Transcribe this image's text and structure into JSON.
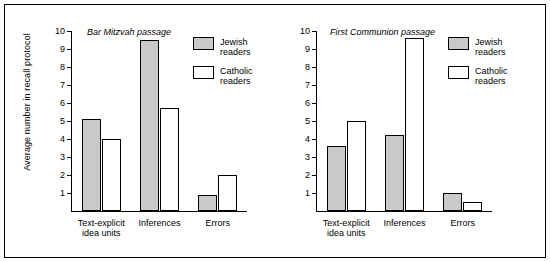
{
  "figure": {
    "ylabel": "Average number in recall protocol",
    "legend": [
      {
        "key": "jewish",
        "label": "Jewish\nreaders",
        "fill": "#c9c9c9"
      },
      {
        "key": "catholic",
        "label": "Catholic\nreaders",
        "fill": "#ffffff"
      }
    ]
  },
  "chart_data": [
    {
      "type": "bar",
      "title": "Bar Mitzvah passage",
      "categories": [
        "Text-explicit\nidea units",
        "Inferences",
        "Errors"
      ],
      "series": [
        {
          "name": "Jewish readers",
          "values": [
            5.1,
            9.5,
            0.9
          ]
        },
        {
          "name": "Catholic readers",
          "values": [
            4.0,
            5.7,
            2.0
          ]
        }
      ],
      "xlabel": "",
      "ylabel": "Average number in recall protocol",
      "ylim": [
        0,
        10
      ],
      "yticks": [
        1,
        2,
        3,
        4,
        5,
        6,
        7,
        8,
        9,
        10
      ],
      "grid": false,
      "legend_position": "top-right"
    },
    {
      "type": "bar",
      "title": "First Communion passage",
      "categories": [
        "Text-explicit\nidea units",
        "Inferences",
        "Errors"
      ],
      "series": [
        {
          "name": "Jewish readers",
          "values": [
            3.6,
            4.2,
            1.0
          ]
        },
        {
          "name": "Catholic readers",
          "values": [
            5.0,
            9.6,
            0.5
          ]
        }
      ],
      "xlabel": "",
      "ylabel": "",
      "ylim": [
        0,
        10
      ],
      "yticks": [
        1,
        2,
        3,
        4,
        5,
        6,
        7,
        8,
        9,
        10
      ],
      "grid": false,
      "legend_position": "top-right"
    }
  ]
}
